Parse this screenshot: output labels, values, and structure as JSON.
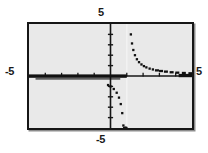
{
  "labels": {
    "top": "5",
    "bottom": "-5",
    "left": "-5",
    "right": "5"
  },
  "colors": {
    "frame": "#161616",
    "background": "#e9e9e9",
    "curve": "#111111",
    "axis": "#161616",
    "asymptote": "#f2f2f2"
  },
  "chart_data": {
    "type": "scatter",
    "title": "",
    "xlabel": "",
    "ylabel": "",
    "xlim": [
      -5,
      5
    ],
    "ylim": [
      -5,
      5
    ],
    "xticks": [
      -4,
      -3,
      -2,
      -1,
      1,
      2,
      3,
      4
    ],
    "yticks": [
      -4,
      -3,
      -2,
      -1,
      1,
      2,
      3,
      4
    ],
    "grid": false,
    "legend": false,
    "legend_position": "none",
    "annotations": [
      "vertical asymptote at x = 1",
      "horizontal asymptote at y = 0"
    ],
    "series": [
      {
        "name": "upper right branch",
        "comment": "y = 1/(x-1) for x > 1",
        "x": [
          1.25,
          1.32,
          1.4,
          1.5,
          1.62,
          1.75,
          1.9,
          2.05,
          2.2,
          2.4,
          2.6,
          2.85,
          3.1,
          3.4,
          3.75,
          4.1,
          4.5,
          4.9
        ],
        "y": [
          4.0,
          3.13,
          2.5,
          2.0,
          1.61,
          1.33,
          1.11,
          0.95,
          0.83,
          0.71,
          0.63,
          0.54,
          0.48,
          0.42,
          0.36,
          0.32,
          0.29,
          0.26
        ]
      },
      {
        "name": "lower left branch",
        "comment": "y = 1/(x-1) for x < 1",
        "x": [
          -0.15,
          0.0,
          0.2,
          0.38,
          0.52,
          0.63,
          0.72,
          0.79,
          0.84,
          0.88,
          0.91,
          0.935,
          0.955,
          0.97
        ],
        "y": [
          -0.87,
          -1.0,
          -1.25,
          -1.61,
          -2.08,
          -2.7,
          -3.57,
          -4.76,
          -5.0,
          -5.0,
          -5.0,
          -5.0,
          -5.0,
          -5.0
        ]
      },
      {
        "name": "horizontal asymptote trace",
        "comment": "thick dark run along y = 0 from x = -5 to x = 1 and x = 4.2 to 5",
        "x": [
          -5,
          1
        ],
        "y": [
          0,
          0
        ]
      }
    ]
  }
}
